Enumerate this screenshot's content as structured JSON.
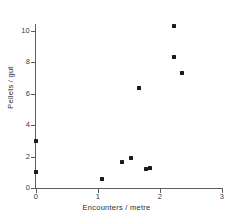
{
  "chart_data": {
    "type": "scatter",
    "title": "",
    "xlabel": "Encounters / metre",
    "ylabel": "Pellets / gut",
    "xlim": [
      0,
      3
    ],
    "ylim": [
      0,
      11
    ],
    "xticks": [
      0,
      1,
      2,
      3
    ],
    "yticks": [
      0,
      2,
      4,
      6,
      8,
      10
    ],
    "xticklabels": [
      "0",
      "1",
      "2",
      "3"
    ],
    "yticklabels": [
      "0",
      "2",
      "4",
      "6",
      "8",
      "10"
    ],
    "grid": false,
    "legend": false,
    "marker": "square",
    "marker_color": "#1a1a1a",
    "axis_color": "#5c5c5c",
    "background": "#ffffff",
    "points": [
      {
        "x": 0.0,
        "y": 1.0
      },
      {
        "x": 0.0,
        "y": 3.0
      },
      {
        "x": 1.07,
        "y": 0.6
      },
      {
        "x": 1.39,
        "y": 1.65
      },
      {
        "x": 1.53,
        "y": 1.9
      },
      {
        "x": 1.66,
        "y": 6.4
      },
      {
        "x": 1.77,
        "y": 1.2
      },
      {
        "x": 1.84,
        "y": 1.25
      },
      {
        "x": 2.23,
        "y": 10.3
      },
      {
        "x": 2.23,
        "y": 8.35
      },
      {
        "x": 2.35,
        "y": 7.3
      }
    ]
  }
}
